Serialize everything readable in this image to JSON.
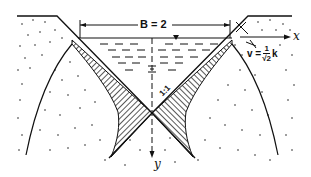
{
  "diagram": {
    "type": "seepage-from-v-shaped-channel",
    "labels": {
      "width_dimension": "B = 2",
      "x_axis": "x",
      "y_axis": "y",
      "slope": "1:1",
      "velocity_prefix": "v =",
      "velocity_num": "1",
      "velocity_den": "√2",
      "velocity_suffix": "k"
    },
    "colors": {
      "ink": "#111111",
      "background": "#ffffff"
    }
  }
}
